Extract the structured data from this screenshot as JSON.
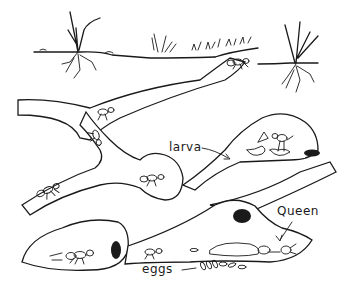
{
  "diagram": {
    "labels": {
      "larva": "larva",
      "queen": "Queen",
      "eggs": "eggs"
    },
    "elements": [
      "ground-surface",
      "grass-tufts",
      "plant-roots",
      "tunnels",
      "chambers",
      "worker-ants",
      "larvae",
      "queen",
      "eggs",
      "chamber-entrances"
    ],
    "colors": {
      "ink": "#1a1a1a",
      "background": "#ffffff",
      "soil-stipple": "#9a9a9a"
    }
  }
}
